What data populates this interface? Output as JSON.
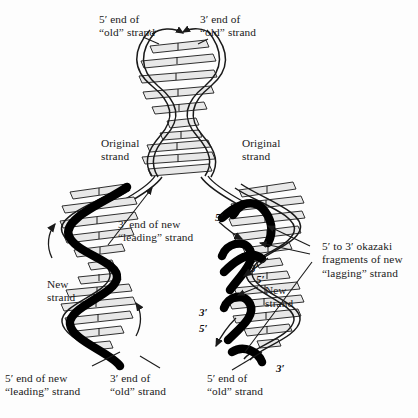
{
  "diagram": {
    "background_color": "#fdfdfd",
    "ink_color": "#1a1a1a",
    "new_strand_color": "#000000",
    "rung_fill_color": "#e8e8e8"
  },
  "labels": {
    "top_left": "5′ end of\n“old” strand",
    "top_right": "3′ end of\n“old” strand",
    "original_left": "Original\nstrand",
    "original_right": "Original\nstrand",
    "leading_3prime": "3′ end of new\n“leading” strand",
    "new_strand_left": "New\nstrand",
    "new_strand_right": "New\nstrand",
    "okazaki": "5′ to 3′ okazaki\nfragments of new\n“lagging” strand",
    "bottom_leading": "5′ end of new\n“leading” strand",
    "bottom_old_left": "3′ end of\n“old” strand",
    "bottom_old_right": "5′ end of\n“old” strand"
  },
  "end_markers": {
    "right_fork_5prime_top": "5′",
    "right_frag1_3prime": "3′",
    "right_frag2_5prime": "5′",
    "right_frag2_3prime": "3′",
    "right_frag3_5prime": "5′",
    "bottom_right_3prime": "3′"
  }
}
